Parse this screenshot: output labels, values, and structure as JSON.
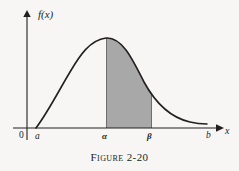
{
  "figure": {
    "caption": "Figure 2-20",
    "background_color": "#f7f6f4",
    "ink_color": "#231f20",
    "shade_color": "#a8a8a8"
  },
  "axes": {
    "y_axis_label": "f(x)",
    "x_axis_label": "x",
    "origin_label": "0"
  },
  "ticks": {
    "a": "a",
    "alpha": "α",
    "beta": "β",
    "b": "b"
  },
  "chart_data": {
    "type": "area",
    "title": "Figure 2-20",
    "xlabel": "x",
    "ylabel": "f(x)",
    "grid": false,
    "legend": "none",
    "xlim": [
      0,
      239
    ],
    "ylim": [
      0,
      128
    ],
    "x_tick_labels": [
      "0",
      "a",
      "α",
      "β",
      "b"
    ],
    "x_tick_positions": [
      27,
      36,
      106,
      152,
      209
    ],
    "curve_points": [
      [
        36,
        128
      ],
      [
        41,
        116
      ],
      [
        47,
        103
      ],
      [
        53,
        91
      ],
      [
        59,
        80
      ],
      [
        66,
        69
      ],
      [
        73,
        59
      ],
      [
        80,
        50
      ],
      [
        87,
        44
      ],
      [
        94,
        40
      ],
      [
        100,
        38
      ],
      [
        106,
        38
      ],
      [
        113,
        41
      ],
      [
        120,
        47
      ],
      [
        127,
        56
      ],
      [
        134,
        67
      ],
      [
        141,
        79
      ],
      [
        148,
        90
      ],
      [
        155,
        100
      ],
      [
        162,
        107
      ],
      [
        170,
        113
      ],
      [
        178,
        117
      ],
      [
        186,
        120
      ],
      [
        194,
        122
      ],
      [
        200,
        123
      ],
      [
        207,
        124
      ]
    ],
    "shaded_region": {
      "from_label": "α",
      "to_label": "β",
      "from_x": 106,
      "to_x": 152,
      "fill": "#a8a8a8"
    },
    "annotations": [
      "curve f(x) defined on interval a to b",
      "shaded area under f(x) between alpha and beta"
    ]
  }
}
